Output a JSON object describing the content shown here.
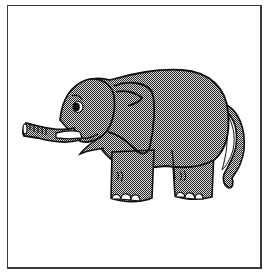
{
  "image": {
    "subject": "Cartoon elephant standing, facing left, trunk extended",
    "alt": "Grey dithered clip-art elephant inside a thin black frame",
    "colors": {
      "outline": "#111111",
      "fill_dark": "#2a2a2a",
      "fill_light": "#d8d8d8",
      "background": "#ffffff",
      "frame": "#3a3a3a"
    },
    "parts": [
      "trunk",
      "tusk",
      "eye",
      "ear",
      "body",
      "front-leg",
      "back-leg",
      "tail",
      "toenails"
    ]
  }
}
